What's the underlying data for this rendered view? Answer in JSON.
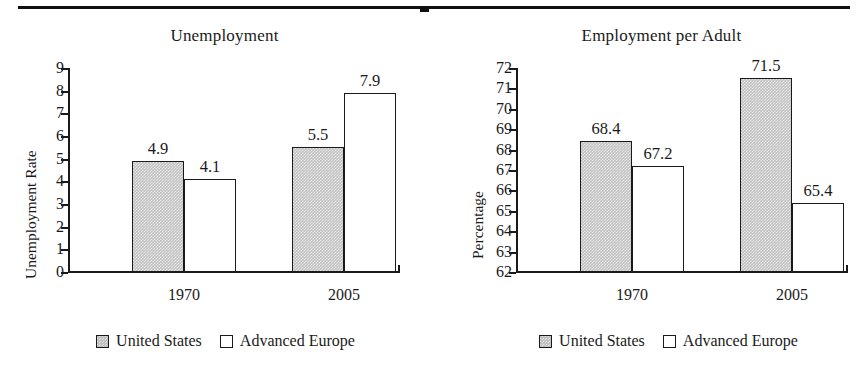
{
  "figure": {
    "top_rule": true
  },
  "chart_data": [
    {
      "type": "bar",
      "title": "Unemployment",
      "xlabel": "",
      "ylabel": "Unemployment Rate",
      "categories": [
        "1970",
        "2005"
      ],
      "ylim": [
        0,
        9
      ],
      "ytick_step": 1,
      "yticks": [
        "0",
        "1",
        "2",
        "3",
        "4",
        "5",
        "6",
        "7",
        "8",
        "9"
      ],
      "grid": false,
      "legend_position": "bottom-center",
      "series": [
        {
          "name": "United States",
          "color": "#c2c2c2",
          "values": [
            4.9,
            5.5
          ],
          "labels": [
            "4.9",
            "5.5"
          ]
        },
        {
          "name": "Advanced Europe",
          "color": "#ffffff",
          "values": [
            4.1,
            7.9
          ],
          "labels": [
            "4.1",
            "7.9"
          ]
        }
      ]
    },
    {
      "type": "bar",
      "title": "Employment per Adult",
      "xlabel": "",
      "ylabel": "Percentage",
      "categories": [
        "1970",
        "2005"
      ],
      "ylim": [
        62,
        72
      ],
      "ytick_step": 1,
      "yticks": [
        "62",
        "63",
        "64",
        "65",
        "66",
        "67",
        "68",
        "69",
        "70",
        "71",
        "72"
      ],
      "grid": false,
      "legend_position": "bottom-center",
      "series": [
        {
          "name": "United States",
          "color": "#c2c2c2",
          "values": [
            68.4,
            71.5
          ],
          "labels": [
            "68.4",
            "71.5"
          ]
        },
        {
          "name": "Advanced Europe",
          "color": "#ffffff",
          "values": [
            67.2,
            65.4
          ],
          "labels": [
            "67.2",
            "65.4"
          ]
        }
      ]
    }
  ]
}
